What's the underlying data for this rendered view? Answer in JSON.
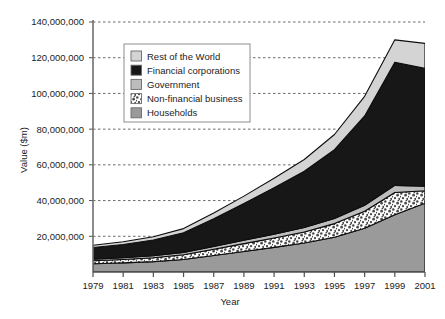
{
  "chart_data": {
    "type": "area",
    "stacked": true,
    "title": "",
    "xlabel": "Year",
    "ylabel": "Value ($m)",
    "x": [
      1979,
      1981,
      1983,
      1985,
      1987,
      1989,
      1991,
      1993,
      1995,
      1997,
      1999,
      2001
    ],
    "xtick_labels": [
      "1979",
      "1981",
      "1983",
      "1985",
      "1987",
      "1989",
      "1991",
      "1993",
      "1995",
      "1997",
      "1999",
      "2001"
    ],
    "xlim": [
      1979,
      2001
    ],
    "ylim": [
      0,
      140000000
    ],
    "ytick_labels": [
      "20,000,000",
      "40,000,000",
      "60,000,000",
      "80,000,000",
      "100,000,000",
      "120,000,000",
      "140,000,000"
    ],
    "yticks": [
      20000000,
      40000000,
      60000000,
      80000000,
      100000000,
      120000000,
      140000000
    ],
    "grid": true,
    "grid_style": "dashed-horizontal",
    "legend_position": "upper-left-inside",
    "stack_order_bottom_to_top": [
      "Households",
      "Non-financial business",
      "Government",
      "Financial corporations",
      "Rest of the World"
    ],
    "series": [
      {
        "name": "Households",
        "color": "#9a9a9a",
        "pattern": "solid",
        "values": [
          4600000,
          5100000,
          5800000,
          7000000,
          9200000,
          11500000,
          13800000,
          16200000,
          19500000,
          24500000,
          32000000,
          38500000
        ]
      },
      {
        "name": "Non-financial business",
        "color": "#ffffff",
        "pattern": "stipple",
        "values": [
          1700000,
          1900000,
          2200000,
          2700000,
          3500000,
          4400000,
          5200000,
          6200000,
          7600000,
          9500000,
          12500000,
          7000000
        ]
      },
      {
        "name": "Government",
        "color": "#bdbdbd",
        "pattern": "solid",
        "values": [
          900000,
          1000000,
          1100000,
          1300000,
          1600000,
          1900000,
          2200000,
          2500000,
          2900000,
          3400000,
          4000000,
          2500000
        ]
      },
      {
        "name": "Financial corporations",
        "color": "#171717",
        "pattern": "solid",
        "values": [
          6500000,
          7400000,
          8800000,
          11000000,
          15500000,
          20500000,
          26000000,
          31500000,
          38500000,
          50000000,
          69000000,
          66000000
        ]
      },
      {
        "name": "Rest of the World",
        "color": "#d4d4d4",
        "pattern": "solid",
        "values": [
          1300000,
          1500000,
          1800000,
          2300000,
          3200000,
          4200000,
          5300000,
          6600000,
          8500000,
          11000000,
          12500000,
          14000000
        ]
      }
    ],
    "totals": [
      15000000,
      16900000,
      19700000,
      24300000,
      33000000,
      42500000,
      52500000,
      63000000,
      77000000,
      98400000,
      130000000,
      128000000
    ]
  },
  "legend": {
    "items": [
      {
        "label": "Rest of the World",
        "swatch": "#d4d4d4"
      },
      {
        "label": "Financial corporations",
        "swatch": "#171717"
      },
      {
        "label": "Government",
        "swatch": "#bdbdbd"
      },
      {
        "label": "Non-financial business",
        "swatch": "#ffffff"
      },
      {
        "label": "Households",
        "swatch": "#9a9a9a"
      }
    ]
  },
  "axes": {
    "y_title": "Value ($m)",
    "x_title": "Year"
  }
}
